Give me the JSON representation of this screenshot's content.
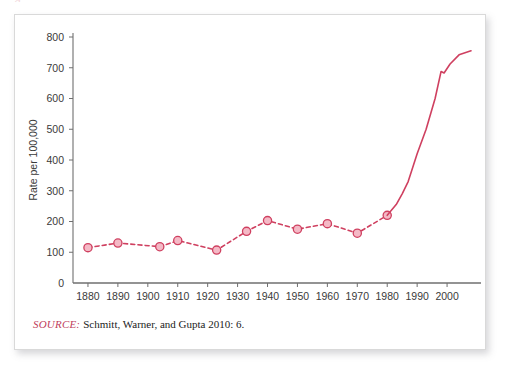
{
  "figure": {
    "bleed_glyph": "g",
    "source": {
      "label": "SOURCE:",
      "text": "Schmitt, Warner, and Gupta 2010: 6."
    }
  },
  "colors": {
    "line": "#cf4060",
    "marker_fill": "#f4b9c6",
    "marker_stroke": "#cf4060",
    "axis": "#6f6f6f",
    "tick_text": "#3a3a3a",
    "source_label": "#c0405c",
    "card_border": "#d9d9d9"
  },
  "chart_data": {
    "type": "line",
    "title": "",
    "xlabel": "",
    "ylabel": "Rate per 100,000",
    "xlim": [
      1875,
      2010
    ],
    "ylim": [
      0,
      800
    ],
    "grid": false,
    "legend": false,
    "y_ticks": [
      0,
      100,
      200,
      300,
      400,
      500,
      600,
      700,
      800
    ],
    "y_tick_labels": [
      "0",
      "100",
      "200",
      "300",
      "400",
      "500",
      "600",
      "700",
      "800"
    ],
    "x_ticks": [
      1880,
      1890,
      1900,
      1910,
      1920,
      1930,
      1940,
      1950,
      1960,
      1970,
      1980,
      1990,
      2000
    ],
    "x_tick_labels": [
      "1880",
      "1890",
      "1900",
      "1910",
      "1920",
      "1930",
      "1940",
      "1950",
      "1960",
      "1970",
      "1980",
      "1990",
      "2000"
    ],
    "series": [
      {
        "name": "Incarceration rate",
        "style": "dashed-with-markers",
        "x": [
          1880,
          1890,
          1904,
          1910,
          1923,
          1933,
          1940,
          1950,
          1960,
          1970,
          1980
        ],
        "values": [
          115,
          130,
          118,
          138,
          107,
          168,
          203,
          175,
          193,
          162,
          220
        ]
      },
      {
        "name": "Incarceration rate (continued)",
        "style": "solid",
        "x": [
          1980,
          1983,
          1985,
          1987,
          1990,
          1993,
          1996,
          1998,
          1999,
          2001,
          2004,
          2008
        ],
        "values": [
          220,
          255,
          290,
          330,
          420,
          500,
          600,
          688,
          683,
          712,
          742,
          755
        ]
      }
    ]
  }
}
